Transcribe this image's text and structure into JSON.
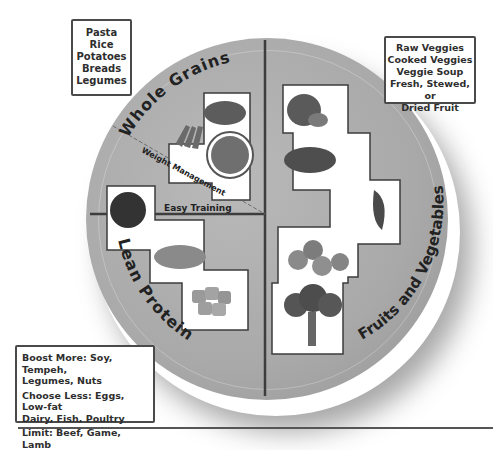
{
  "diagram": {
    "type": "healthy-plate",
    "colors": {
      "plate": "#aaaaaa",
      "divider": "#3d3d3d",
      "box_border": "#4a4a4a",
      "text": "#2e2e2e"
    },
    "sections": {
      "grains": {
        "title": "Whole Grains"
      },
      "protein": {
        "title": "Lean Protein"
      },
      "fruits_veg": {
        "title": "Fruits and Vegetables"
      }
    },
    "divider_labels": {
      "weight_management": "Weight Management",
      "easy_training": "Easy Training"
    },
    "callouts": {
      "grains": {
        "lines": [
          "Pasta",
          "Rice",
          "Potatoes",
          "Breads",
          "Legumes"
        ]
      },
      "fruits_veg": {
        "lines": [
          "Raw Veggies",
          "Cooked Veggies",
          "Veggie Soup",
          "Fresh, Stewed, or",
          "Dried Fruit"
        ]
      },
      "protein": {
        "lines": [
          "Boost More: Soy, Tempeh,",
          "Legumes, Nuts",
          "Choose Less: Eggs, Low-fat",
          "Dairy, Fish, Poultry",
          "Limit: Beef, Game, Lamb"
        ]
      }
    },
    "food_images": [
      {
        "name": "grain-pile"
      },
      {
        "name": "potato-wedges"
      },
      {
        "name": "pasta-bowl"
      },
      {
        "name": "black-beans"
      },
      {
        "name": "lentils"
      },
      {
        "name": "tofu-cubes"
      },
      {
        "name": "mango"
      },
      {
        "name": "pomegranate"
      },
      {
        "name": "leafy-greens"
      },
      {
        "name": "dried-figs"
      },
      {
        "name": "broccoli"
      }
    ]
  }
}
